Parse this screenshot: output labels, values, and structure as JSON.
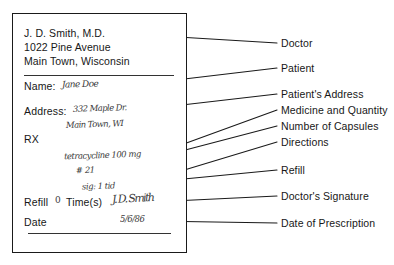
{
  "form": {
    "header": {
      "doctor_name": "J. D. Smith, M.D.",
      "street": "1022 Pine Avenue",
      "city_state": "Main Town, Wisconsin"
    },
    "fields": {
      "name_label": "Name:",
      "address_label": "Address:",
      "rx_label": "RX",
      "refill_label": "Refill",
      "refill_count": "0",
      "times_label": "Time(s)",
      "date_label": "Date"
    },
    "handwriting": {
      "patient_name": "Jane Doe",
      "address_line1": "332 Maple Dr.",
      "address_line2": "Main Town, WI",
      "medicine": "tetracycline 100 mg",
      "quantity": "# 21",
      "directions": "sig: 1 tid",
      "signature": "J. D. Smith",
      "date": "5/6/86"
    }
  },
  "callouts": [
    {
      "label": "Doctor"
    },
    {
      "label": "Patient"
    },
    {
      "label": "Patient's Address"
    },
    {
      "label": "Medicine and Quantity"
    },
    {
      "label": "Number of Capsules"
    },
    {
      "label": "Directions"
    },
    {
      "label": "Refill"
    },
    {
      "label": "Doctor's Signature"
    },
    {
      "label": "Date of Prescription"
    }
  ],
  "colors": {
    "ink": "#171717",
    "rule": "#333333",
    "paper": "#ffffff"
  }
}
